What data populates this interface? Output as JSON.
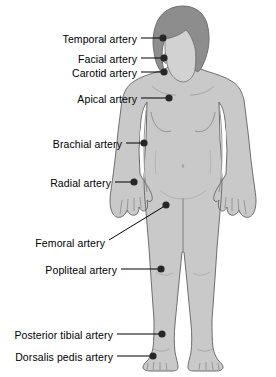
{
  "diagram": {
    "colors": {
      "body_fill": "#c9c9c9",
      "body_outline": "#6e6e6e",
      "hair_fill": "#8d8d8d",
      "face_fill": "#d2d2d2",
      "marker": "#262626",
      "leader_line": "#000000",
      "label_text": "#000000",
      "background": "#ffffff"
    },
    "marker_radius": 3.6,
    "labels": [
      {
        "id": "temporal",
        "text": "Temporal artery",
        "text_x": 137,
        "text_y": 34,
        "align": "right",
        "leader": {
          "x1": 141,
          "y1": 38,
          "x2": 160,
          "y2": 38
        },
        "dot": {
          "cx": 163,
          "cy": 38
        }
      },
      {
        "id": "facial",
        "text": "Facial artery",
        "text_x": 137,
        "text_y": 54,
        "align": "right",
        "leader": {
          "x1": 141,
          "y1": 58,
          "x2": 161,
          "y2": 58
        },
        "dot": {
          "cx": 164,
          "cy": 58
        }
      },
      {
        "id": "carotid",
        "text": "Carotid artery",
        "text_x": 137,
        "text_y": 68,
        "align": "right",
        "leader": {
          "x1": 141,
          "y1": 72,
          "x2": 161,
          "y2": 72
        },
        "dot": {
          "cx": 164,
          "cy": 72
        }
      },
      {
        "id": "apical",
        "text": "Apical artery",
        "text_x": 137,
        "text_y": 94,
        "align": "right",
        "leader": {
          "x1": 141,
          "y1": 98,
          "x2": 166,
          "y2": 98
        },
        "dot": {
          "cx": 169,
          "cy": 98
        }
      },
      {
        "id": "brachial",
        "text": "Brachial artery",
        "text_x": 122,
        "text_y": 139,
        "align": "right",
        "leader": {
          "x1": 126,
          "y1": 143,
          "x2": 141,
          "y2": 143
        },
        "dot": {
          "cx": 144,
          "cy": 143
        }
      },
      {
        "id": "radial",
        "text": "Radial artery",
        "text_x": 111,
        "text_y": 178,
        "align": "right",
        "leader": {
          "x1": 115,
          "y1": 182,
          "x2": 131,
          "y2": 182
        },
        "dot": {
          "cx": 134,
          "cy": 182
        }
      },
      {
        "id": "femoral",
        "text": "Femoral artery",
        "text_x": 105,
        "text_y": 238,
        "align": "right",
        "leader": {
          "x1": 109,
          "y1": 240,
          "x2": 163,
          "y2": 207
        },
        "dot": {
          "cx": 166,
          "cy": 205
        }
      },
      {
        "id": "popliteal",
        "text": "Popliteal artery",
        "text_x": 117,
        "text_y": 265,
        "align": "right",
        "leader": {
          "x1": 121,
          "y1": 269,
          "x2": 158,
          "y2": 269
        },
        "dot": {
          "cx": 161,
          "cy": 269
        }
      },
      {
        "id": "posterior-tibial",
        "text": "Posterior tibial artery",
        "text_x": 113,
        "text_y": 330,
        "align": "right",
        "leader": {
          "x1": 117,
          "y1": 334,
          "x2": 159,
          "y2": 334
        },
        "dot": {
          "cx": 162,
          "cy": 334
        }
      },
      {
        "id": "dorsalis-pedis",
        "text": "Dorsalis pedis artery",
        "text_x": 113,
        "text_y": 352,
        "align": "right",
        "leader": {
          "x1": 117,
          "y1": 356,
          "x2": 150,
          "y2": 356
        },
        "dot": {
          "cx": 153,
          "cy": 356
        }
      }
    ]
  }
}
